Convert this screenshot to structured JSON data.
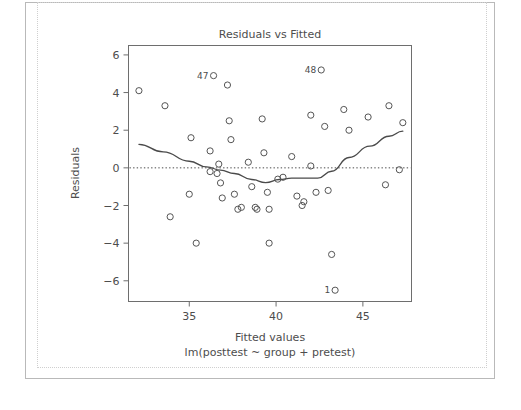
{
  "figure": {
    "title": "Residuals vs Fitted",
    "xlabel": "Fitted values",
    "xsublabel": "lm(posttest ~ group + pretest)",
    "ylabel": "Residuals"
  },
  "colors": {
    "axis": "#6e6e6e",
    "text": "#4d4d4d",
    "point": "#555555",
    "smoother": "#4a4a4a",
    "zero_line": "#4a4a4a",
    "page_border": "#b9b9b9",
    "page_border_inner": "#cfcfcf",
    "background": "#ffffff"
  },
  "chart_data": {
    "type": "scatter",
    "title": "Residuals vs Fitted",
    "xlabel": "Fitted values",
    "sublabel": "lm(posttest ~ group + pretest)",
    "ylabel": "Residuals",
    "xlim": [
      31.5,
      47.8
    ],
    "ylim": [
      -7.1,
      6.5
    ],
    "xticks": [
      35,
      40,
      45
    ],
    "yticks": [
      6,
      4,
      2,
      0,
      -2,
      -4,
      -6
    ],
    "grid": false,
    "legend": null,
    "marker": "open-circle",
    "reference_lines": [
      {
        "name": "zero-residual-line",
        "type": "horizontal-dotted",
        "y": 0
      }
    ],
    "points": [
      {
        "x": 32.1,
        "y": 4.1
      },
      {
        "x": 33.6,
        "y": 3.3
      },
      {
        "x": 33.9,
        "y": -2.6
      },
      {
        "x": 35.1,
        "y": 1.6
      },
      {
        "x": 35.0,
        "y": -1.4
      },
      {
        "x": 35.4,
        "y": -4.0
      },
      {
        "x": 36.2,
        "y": 0.9
      },
      {
        "x": 36.2,
        "y": -0.2
      },
      {
        "x": 36.4,
        "y": 4.9,
        "label": "47"
      },
      {
        "x": 36.7,
        "y": 0.2
      },
      {
        "x": 36.6,
        "y": -0.3
      },
      {
        "x": 36.8,
        "y": -0.8
      },
      {
        "x": 36.9,
        "y": -1.6
      },
      {
        "x": 37.2,
        "y": 4.4
      },
      {
        "x": 37.3,
        "y": 2.5
      },
      {
        "x": 37.4,
        "y": 1.5
      },
      {
        "x": 37.6,
        "y": -1.4
      },
      {
        "x": 37.8,
        "y": -2.2
      },
      {
        "x": 38.0,
        "y": -2.1
      },
      {
        "x": 38.4,
        "y": 0.3
      },
      {
        "x": 38.6,
        "y": -1.0
      },
      {
        "x": 38.8,
        "y": -2.1
      },
      {
        "x": 38.9,
        "y": -2.2
      },
      {
        "x": 39.2,
        "y": 2.6
      },
      {
        "x": 39.3,
        "y": 0.8
      },
      {
        "x": 39.5,
        "y": -1.3
      },
      {
        "x": 39.6,
        "y": -2.2
      },
      {
        "x": 39.6,
        "y": -4.0
      },
      {
        "x": 40.1,
        "y": -0.6
      },
      {
        "x": 40.4,
        "y": -0.5
      },
      {
        "x": 40.9,
        "y": 0.6
      },
      {
        "x": 41.2,
        "y": -1.5
      },
      {
        "x": 41.5,
        "y": -2.0
      },
      {
        "x": 41.6,
        "y": -1.8
      },
      {
        "x": 42.0,
        "y": 0.1
      },
      {
        "x": 42.0,
        "y": 2.8
      },
      {
        "x": 42.3,
        "y": -1.3
      },
      {
        "x": 42.6,
        "y": 5.2,
        "label": "48"
      },
      {
        "x": 42.8,
        "y": 2.2
      },
      {
        "x": 43.0,
        "y": -1.2
      },
      {
        "x": 43.2,
        "y": -4.6
      },
      {
        "x": 43.4,
        "y": -6.5,
        "label": "1"
      },
      {
        "x": 43.9,
        "y": 3.1
      },
      {
        "x": 44.2,
        "y": 2.0
      },
      {
        "x": 45.3,
        "y": 2.7
      },
      {
        "x": 46.5,
        "y": 3.3
      },
      {
        "x": 46.3,
        "y": -0.9
      },
      {
        "x": 47.3,
        "y": 2.4
      },
      {
        "x": 47.1,
        "y": -0.1
      }
    ],
    "smoother": {
      "name": "loess-smoother",
      "x": [
        32.1,
        33.5,
        35.0,
        36.0,
        36.8,
        37.6,
        38.6,
        39.4,
        40.2,
        40.9,
        41.7,
        42.4,
        43.2,
        44.2,
        45.4,
        46.5,
        47.3
      ],
      "y": [
        1.25,
        0.85,
        0.35,
        0.05,
        -0.12,
        -0.3,
        -0.62,
        -0.78,
        -0.62,
        -0.55,
        -0.55,
        -0.55,
        -0.18,
        0.55,
        1.15,
        1.68,
        1.95
      ]
    }
  }
}
